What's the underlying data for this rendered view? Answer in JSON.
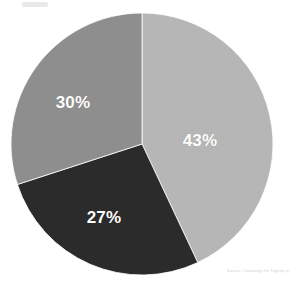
{
  "chart_data": {
    "type": "pie",
    "title": "",
    "subtitle": "",
    "xlabel": "",
    "ylabel": "",
    "legend_position": "none",
    "grid": false,
    "start_angle_deg": 0,
    "direction": "clockwise",
    "categories": [
      "43%",
      "27%",
      "30%"
    ],
    "values": [
      43,
      27,
      30
    ],
    "slices": [
      {
        "label": "43%",
        "value": 43,
        "color": "#b6b6b6",
        "start_angle_deg": 0,
        "end_angle_deg": 154.8,
        "label_x": 200,
        "label_y": 141
      },
      {
        "label": "27%",
        "value": 27,
        "color": "#2b2b2b",
        "start_angle_deg": 154.8,
        "end_angle_deg": 252.0,
        "label_x": 104,
        "label_y": 218
      },
      {
        "label": "30%",
        "value": 30,
        "color": "#8e8e8e",
        "start_angle_deg": 252.0,
        "end_angle_deg": 360.0,
        "label_x": 73,
        "label_y": 103
      }
    ],
    "label_color": "#ffffff",
    "background_color": "#ffffff",
    "divider_color": "#ffffff"
  },
  "footer": {
    "source_text": "Source: Campaign for Dignity in"
  },
  "icons": {
    "top_artifact": "smudge-artifact"
  }
}
